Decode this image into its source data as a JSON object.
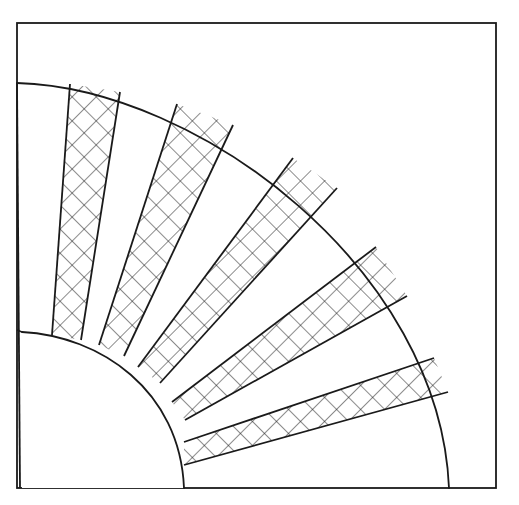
{
  "figure": {
    "stroke_color": "#1a1a1a",
    "background_color": "#ffffff",
    "frame": {
      "x1": 17,
      "y1": 23,
      "x2": 496,
      "y2": 488
    },
    "outer_arc": {
      "start": [
        17,
        83
      ],
      "end": [
        449,
        488
      ],
      "control1": [
        200,
        88
      ],
      "control2": [
        440,
        270
      ]
    },
    "inner_arc": {
      "start": [
        22,
        332
      ],
      "end": [
        184,
        488
      ],
      "control1": [
        100,
        336
      ],
      "control2": [
        180,
        390
      ]
    },
    "hatched_blades": [
      {
        "name": "blade-1",
        "outer": [
          [
            70,
            84
          ],
          [
            120,
            92
          ]
        ],
        "inner": [
          [
            81,
            340
          ],
          [
            52,
            335
          ]
        ]
      },
      {
        "name": "blade-2",
        "outer": [
          [
            177,
            104
          ],
          [
            233,
            125
          ]
        ],
        "inner": [
          [
            124,
            356
          ],
          [
            99,
            345
          ]
        ]
      },
      {
        "name": "blade-3",
        "outer": [
          [
            293,
            158
          ],
          [
            337,
            188
          ]
        ],
        "inner": [
          [
            160,
            383
          ],
          [
            138,
            367
          ]
        ]
      },
      {
        "name": "blade-4",
        "outer": [
          [
            376,
            247
          ],
          [
            407,
            296
          ]
        ],
        "inner": [
          [
            185,
            420
          ],
          [
            172,
            402
          ]
        ]
      },
      {
        "name": "blade-5",
        "outer": [
          [
            434,
            358
          ],
          [
            448,
            392
          ]
        ],
        "inner": [
          [
            184,
            465
          ],
          [
            184,
            442
          ]
        ]
      }
    ],
    "hatch_spacing": 17
  }
}
